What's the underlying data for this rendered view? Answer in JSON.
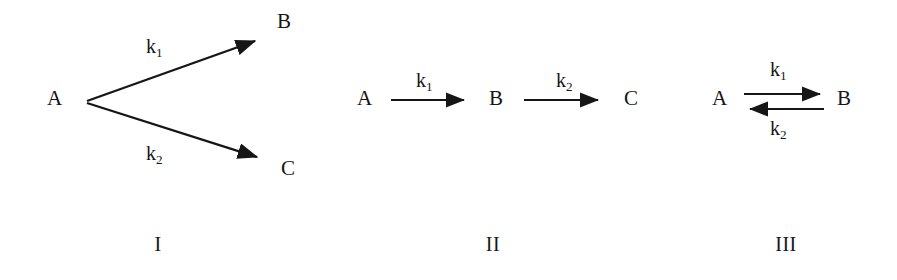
{
  "figure": {
    "background_color": "#ffffff",
    "ink_color": "#161616",
    "width": 897,
    "height": 280
  },
  "schemes": [
    {
      "id": "scheme-1",
      "numeral": "I",
      "type": "parallel-branching",
      "reactant": "A",
      "products": [
        "B",
        "C"
      ],
      "species": {
        "a": "A",
        "b": "B",
        "c": "C"
      },
      "rate_constants": {
        "k1_base": "k",
        "k1_sub": "1",
        "k2_base": "k",
        "k2_sub": "2"
      },
      "arrows": [
        {
          "name": "a-to-b",
          "direction": "up-right",
          "label": "k1"
        },
        {
          "name": "a-to-c",
          "direction": "down-right",
          "label": "k2"
        }
      ]
    },
    {
      "id": "scheme-2",
      "numeral": "II",
      "type": "consecutive-series",
      "reactant": "A",
      "products": [
        "B",
        "C"
      ],
      "species": {
        "a": "A",
        "b": "B",
        "c": "C"
      },
      "rate_constants": {
        "k1_base": "k",
        "k1_sub": "1",
        "k2_base": "k",
        "k2_sub": "2"
      },
      "arrows": [
        {
          "name": "a-to-b",
          "direction": "right",
          "label": "k1"
        },
        {
          "name": "b-to-c",
          "direction": "right",
          "label": "k2"
        }
      ]
    },
    {
      "id": "scheme-3",
      "numeral": "III",
      "type": "reversible-equilibrium",
      "reactant": "A",
      "products": [
        "B"
      ],
      "species": {
        "a": "A",
        "b": "B"
      },
      "rate_constants": {
        "k1_base": "k",
        "k1_sub": "1",
        "k2_base": "k",
        "k2_sub": "2"
      },
      "arrows": [
        {
          "name": "a-to-b-forward",
          "direction": "right",
          "label": "k1"
        },
        {
          "name": "b-to-a-reverse",
          "direction": "left",
          "label": "k2"
        }
      ]
    }
  ]
}
